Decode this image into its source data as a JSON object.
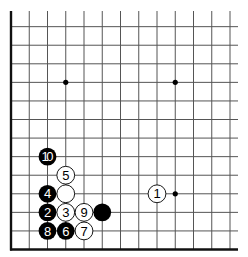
{
  "diagram": {
    "type": "go-board-corner",
    "corner": "bottom-left",
    "grid": {
      "columns_visible": 13,
      "rows_visible": 13,
      "origin_x": 11,
      "origin_y": 249.5,
      "spacing_x": 18.25,
      "spacing_y": 18.57,
      "line_color": "#555555",
      "edge_color": "#111111"
    },
    "star_points": [
      {
        "col": 3,
        "row": 9
      },
      {
        "col": 9,
        "row": 9
      },
      {
        "col": 9,
        "row": 3
      }
    ],
    "stones": [
      {
        "color": "white",
        "col": 8,
        "row": 3,
        "label": "1"
      },
      {
        "color": "black",
        "col": 2,
        "row": 2,
        "label": "2"
      },
      {
        "color": "white",
        "col": 3,
        "row": 2,
        "label": "3"
      },
      {
        "color": "black",
        "col": 2,
        "row": 3,
        "label": "4"
      },
      {
        "color": "white",
        "col": 3,
        "row": 4,
        "label": "5"
      },
      {
        "color": "black",
        "col": 3,
        "row": 1,
        "label": "6"
      },
      {
        "color": "white",
        "col": 4,
        "row": 1,
        "label": "7"
      },
      {
        "color": "black",
        "col": 2,
        "row": 1,
        "label": "8"
      },
      {
        "color": "white",
        "col": 4,
        "row": 2,
        "label": "9"
      },
      {
        "color": "black",
        "col": 2,
        "row": 5,
        "label": "10"
      },
      {
        "color": "white",
        "col": 3,
        "row": 3,
        "label": ""
      },
      {
        "color": "black",
        "col": 5,
        "row": 2,
        "label": ""
      }
    ]
  }
}
